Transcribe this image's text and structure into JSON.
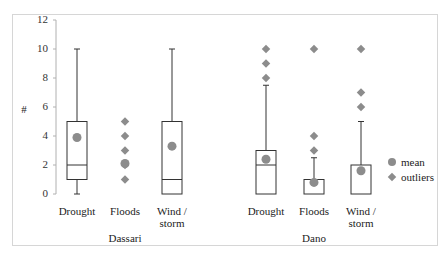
{
  "chart_data": {
    "type": "box",
    "title": "",
    "xlabel": "",
    "ylabel": "#",
    "ylim": [
      0,
      12
    ],
    "yticks": [
      0,
      2,
      4,
      6,
      8,
      10,
      12
    ],
    "grid": false,
    "groups": [
      "Dassari",
      "Dano"
    ],
    "categories": [
      "Drought",
      "Floods",
      "Wind / storm"
    ],
    "series": [
      {
        "group": "Dassari",
        "category": "Drought",
        "min": 0,
        "q1": 1,
        "median": 2,
        "q3": 5,
        "max": 10,
        "mean": 3.9,
        "outliers": []
      },
      {
        "group": "Dassari",
        "category": "Floods",
        "min": null,
        "q1": null,
        "median": null,
        "q3": null,
        "max": null,
        "mean": 2.1,
        "outliers": [
          1,
          2,
          3,
          4,
          5
        ]
      },
      {
        "group": "Dassari",
        "category": "Wind / storm",
        "min": 0,
        "q1": 0,
        "median": 1,
        "q3": 5,
        "max": 10,
        "mean": 3.3,
        "outliers": []
      },
      {
        "group": "Dano",
        "category": "Drought",
        "min": 0,
        "q1": 0,
        "median": 2,
        "q3": 3,
        "max": 7.5,
        "mean": 2.4,
        "outliers": [
          8,
          9,
          10
        ]
      },
      {
        "group": "Dano",
        "category": "Floods",
        "min": 0,
        "q1": 0,
        "median": 0,
        "q3": 1,
        "max": 2.5,
        "mean": 0.8,
        "outliers": [
          3,
          4,
          10
        ]
      },
      {
        "group": "Dano",
        "category": "Wind / storm",
        "min": 0,
        "q1": 0,
        "median": 0,
        "q3": 2,
        "max": 5,
        "mean": 1.6,
        "outliers": [
          6,
          7,
          10
        ]
      }
    ],
    "legend": [
      {
        "label": "mean",
        "marker": "circle",
        "color": "#8c8c8c"
      },
      {
        "label": "outliers",
        "marker": "diamond",
        "color": "#8c8c8c"
      }
    ],
    "legend_position": "right"
  },
  "axis": {
    "ylabel": "#",
    "ticks": [
      "0",
      "2",
      "4",
      "6",
      "8",
      "10",
      "12"
    ]
  },
  "xlabels": {
    "dassari_drought": "Drought",
    "dassari_floods": "Floods",
    "dassari_wind_1": "Wind /",
    "dassari_wind_2": "storm",
    "dano_drought": "Drought",
    "dano_floods": "Floods",
    "dano_wind_1": "Wind /",
    "dano_wind_2": "storm",
    "group_dassari": "Dassari",
    "group_dano": "Dano"
  },
  "legend": {
    "mean": "mean",
    "outliers": "outliers"
  },
  "colors": {
    "marker": "#8c8c8c",
    "box_stroke": "#333333",
    "whisker": "#333333",
    "frame": "#d6d6d6"
  }
}
